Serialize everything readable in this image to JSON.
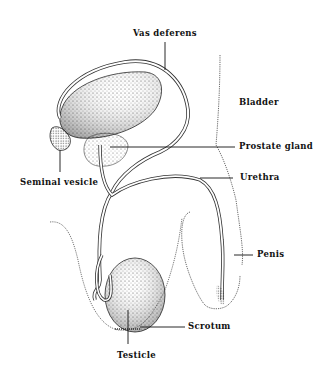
{
  "diagram": {
    "type": "anatomical illustration",
    "labels": [
      {
        "id": "vas-deferens",
        "text": "Vas deferens"
      },
      {
        "id": "bladder",
        "text": "Bladder"
      },
      {
        "id": "prostate-gland",
        "text": "Prostate gland"
      },
      {
        "id": "seminal-vesicle",
        "text": "Seminal vesicle"
      },
      {
        "id": "urethra",
        "text": "Urethra"
      },
      {
        "id": "penis",
        "text": "Penis"
      },
      {
        "id": "scrotum",
        "text": "Scrotum"
      },
      {
        "id": "testicle",
        "text": "Testicle"
      }
    ]
  }
}
